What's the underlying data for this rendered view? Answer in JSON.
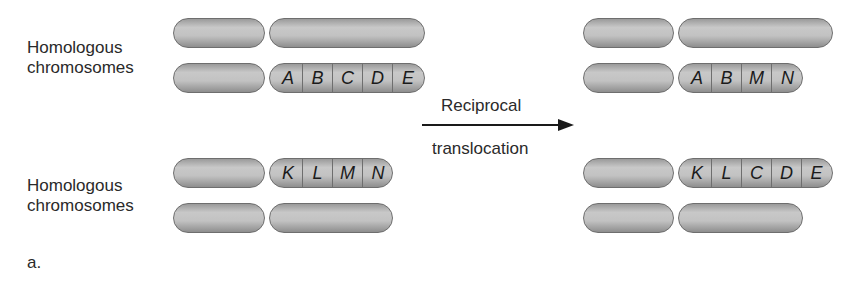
{
  "labels": {
    "homologous_top": "Homologous\nchromosomes",
    "homologous_top_line1": "Homologous",
    "homologous_top_line2": "chromosomes",
    "homologous_bottom_line1": "Homologous",
    "homologous_bottom_line2": "chromosomes",
    "panel": "a."
  },
  "arrow": {
    "label_top": "Reciprocal",
    "label_bottom": "translocation"
  },
  "before": {
    "pair1": {
      "chrom1": {
        "genes": []
      },
      "chrom2": {
        "genes": [
          "A",
          "B",
          "C",
          "D",
          "E"
        ]
      }
    },
    "pair2": {
      "chrom3": {
        "genes": [
          "K",
          "L",
          "M",
          "N"
        ]
      },
      "chrom4": {
        "genes": []
      }
    }
  },
  "after": {
    "pair1": {
      "chrom1": {
        "genes": []
      },
      "chrom2": {
        "genes": [
          "A",
          "B",
          "M",
          "N"
        ]
      }
    },
    "pair2": {
      "chrom3": {
        "genes": [
          "K",
          "L",
          "C",
          "D",
          "E"
        ]
      },
      "chrom4": {
        "genes": []
      }
    }
  },
  "colors": {
    "chromosome_fill": "#c2c2c2",
    "chromosome_outline": "#6e6e6e",
    "text": "#231f20",
    "arrow": "#1a1a1a"
  }
}
